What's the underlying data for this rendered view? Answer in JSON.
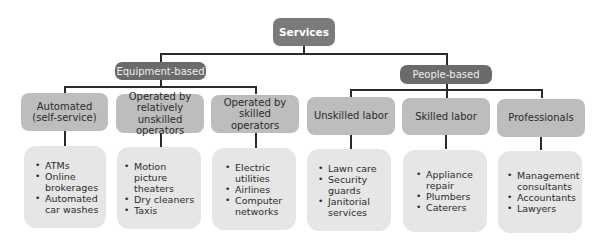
{
  "root": {
    "label": "Services"
  },
  "branches": [
    {
      "label": "Equipment-based",
      "categories": [
        {
          "label": "Automated (self-service)",
          "items": [
            "ATMs",
            "Online brokerages",
            "Automated car washes"
          ]
        },
        {
          "label": "Operated by relatively unskilled operators",
          "items": [
            "Motion picture theaters",
            "Dry cleaners",
            "Taxis"
          ]
        },
        {
          "label": "Operated by skilled operators",
          "items": [
            "Electric utilities",
            "Airlines",
            "Computer networks"
          ]
        }
      ]
    },
    {
      "label": "People-based",
      "categories": [
        {
          "label": "Unskilled labor",
          "items": [
            "Lawn care",
            "Security guards",
            "Janitorial services"
          ]
        },
        {
          "label": "Skilled labor",
          "items": [
            "Appliance repair",
            "Plumbers",
            "Caterers"
          ]
        },
        {
          "label": "Professionals",
          "items": [
            "Management consultants",
            "Accountants",
            "Lawyers"
          ]
        }
      ]
    }
  ],
  "colors": {
    "root": "#7a7a7a",
    "branch": "#6b6b6b",
    "category": "#bdbdbd",
    "list": "#e6e6e6",
    "connector": "#2a2a2a"
  }
}
